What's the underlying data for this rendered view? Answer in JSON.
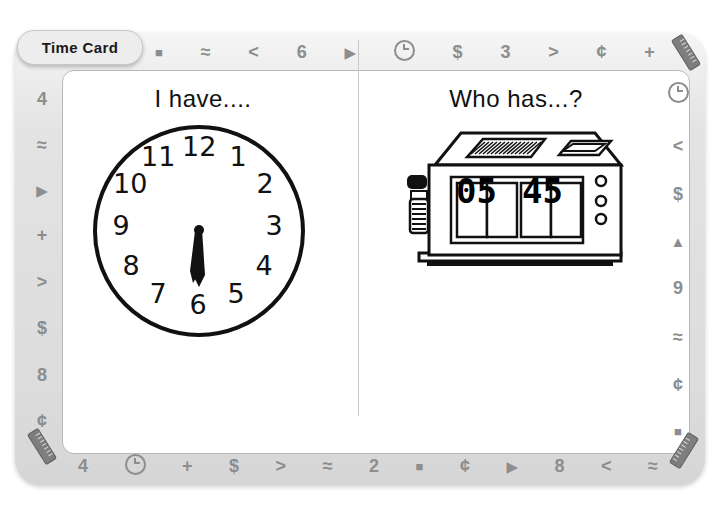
{
  "card": {
    "tab_label": "Time Card",
    "left_prompt": "I have....",
    "right_prompt": "Who has...?"
  },
  "analog_clock": {
    "name": "analog-clock",
    "numerals": [
      "12",
      "1",
      "2",
      "3",
      "4",
      "5",
      "6",
      "7",
      "8",
      "9",
      "10",
      "11"
    ],
    "hour_hand_points_to": "6",
    "minute_hand_points_to": "6",
    "time_shown": "6:30"
  },
  "digital_clock": {
    "name": "flip-clock-radio",
    "hours": "05",
    "minutes": "45",
    "time_shown": "5:45"
  },
  "border": {
    "top": [
      "square",
      "approx",
      "less-than",
      "6",
      "triangle-right",
      "clock",
      "dollar",
      "3",
      "greater-than",
      "cent",
      "plus"
    ],
    "top_glyphs": [
      "■",
      "≈",
      "<",
      "6",
      "▶",
      "clock-icon",
      "$",
      "3",
      ">",
      "¢",
      "+"
    ],
    "left_glyphs": [
      "4",
      "≈",
      "▶",
      "+",
      ">",
      "$",
      "8",
      "¢"
    ],
    "right_glyphs": [
      "clock-icon",
      "<",
      "$",
      "▲",
      "9",
      "≈",
      "¢",
      "■"
    ],
    "bottom_glyphs": [
      "4",
      "clock-icon",
      "+",
      "$",
      ">",
      "≈",
      "2",
      "■",
      "¢",
      "▶",
      "8",
      "<",
      "≈"
    ]
  },
  "colors": {
    "frame": "#e3e3e3",
    "glyph": "#8d8d8d",
    "ink": "#111111",
    "page": "#ffffff"
  }
}
